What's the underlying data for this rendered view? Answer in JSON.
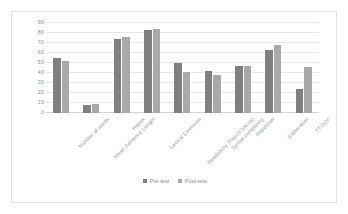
{
  "chart_data": {
    "type": "bar",
    "title": "",
    "subtitle": "",
    "xlabel": "",
    "ylabel": "",
    "ylim": [
      0,
      90
    ],
    "yticks": [
      0,
      10,
      20,
      30,
      40,
      50,
      60,
      70,
      80,
      90
    ],
    "grid": true,
    "legend_position": "bottom-center",
    "orientation": "vertical",
    "grouping": "clustered",
    "categories": [
      "Number of words",
      "Mean Sentence Lenght",
      "Hapax",
      "Lexical Extension",
      "Readability (Flesch Vacca)",
      "Syntax complexity",
      "Repetition",
      "Elaboration",
      "TT-SDI*"
    ],
    "series": [
      {
        "name": "Pre-test",
        "color": "#808080",
        "values": [
          55,
          8,
          74,
          83,
          50,
          42,
          47,
          63,
          24
        ]
      },
      {
        "name": "Post-test",
        "color": "#A9A9A9",
        "values": [
          52,
          9,
          76,
          84,
          41,
          38,
          47,
          68,
          46
        ]
      }
    ]
  },
  "style": {
    "background": "#FFFFFF",
    "border_color": "#E2E2E2",
    "gridline_color": "#E8E8E8",
    "axis_color": "#D4D4D4",
    "tick_text_color": "#8D8D8D"
  }
}
